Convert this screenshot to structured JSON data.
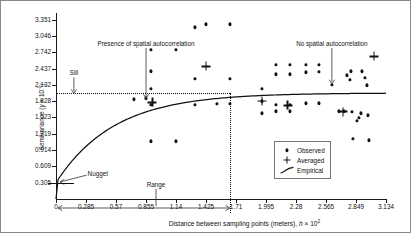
{
  "chart_data": {
    "type": "scatter",
    "title": "",
    "xlabel": "Distance between sampling points (meters), h × 10²",
    "ylabel": "Semivariance (γ × 10⁻¹)",
    "xlabel_parts": {
      "text": "Distance between sampling points (meters), ",
      "italic": "h",
      "times": " × 10",
      "exp": "2"
    },
    "ylabel_parts": {
      "text": "Semivariance (",
      "italic": "γ",
      "times": " × 10",
      "exp": "-1",
      "close": ")"
    },
    "xlim": [
      0,
      3.134
    ],
    "ylim": [
      0,
      3.4725
    ],
    "grid": false,
    "xticks": [
      "0",
      "0.285",
      "0.57",
      "0.855",
      "1.14",
      "1.425",
      "1.71",
      "1.995",
      "2.28",
      "2.565",
      "2.849",
      "3.134"
    ],
    "xtick_values": [
      0,
      0.285,
      0.57,
      0.855,
      1.14,
      1.425,
      1.71,
      1.995,
      2.28,
      2.565,
      2.849,
      3.134
    ],
    "yticks": [
      "0.305",
      "0.609",
      "0.914",
      "1.219",
      "1.523",
      "1.828",
      "2.132",
      "2.437",
      "2.742",
      "3.046",
      "3.351"
    ],
    "ytick_values": [
      0.305,
      0.609,
      0.914,
      1.219,
      1.523,
      1.828,
      2.132,
      2.437,
      2.742,
      3.046,
      3.351
    ],
    "legend_position": "bottom-right",
    "legend": [
      {
        "label": "Observed",
        "marker": "dot"
      },
      {
        "label": "Averaged",
        "marker": "cross"
      },
      {
        "label": "Empirical",
        "marker": "curve"
      }
    ],
    "annotations": [
      {
        "label": "Presence of spatial autocorrelation",
        "x": 0.855,
        "y": 2.95,
        "pointer_to_y": 1.86
      },
      {
        "label": "No spatial autocorrelation",
        "x": 2.62,
        "y": 2.95,
        "pointer_to_y": 2.13
      },
      {
        "label": "Sill",
        "x": 0.17,
        "y": 2.4,
        "pointer_to_y": 1.95
      },
      {
        "label": "Nugget",
        "x": 0.3,
        "y": 0.52,
        "pointer_to_x": 0.02,
        "pointer_to_y": 0.3
      },
      {
        "label": "Range",
        "x": 0.95,
        "y": 0.32
      }
    ],
    "model": {
      "name": "Empirical",
      "nugget": 0.305,
      "sill": 1.98,
      "range": 1.65
    },
    "series": [
      {
        "name": "Observed",
        "marker": "dot",
        "points": [
          [
            0.745,
            1.862
          ],
          [
            0.855,
            1.885
          ],
          [
            0.905,
            2.79
          ],
          [
            0.905,
            2.39
          ],
          [
            0.905,
            2.06
          ],
          [
            0.905,
            1.76
          ],
          [
            1.14,
            2.79
          ],
          [
            1.14,
            1.075
          ],
          [
            0.905,
            1.075
          ],
          [
            1.32,
            3.205
          ],
          [
            1.32,
            2.245
          ],
          [
            1.32,
            1.76
          ],
          [
            1.425,
            3.265
          ],
          [
            1.53,
            1.78
          ],
          [
            1.65,
            3.265
          ],
          [
            1.65,
            2.245
          ],
          [
            1.65,
            1.78
          ],
          [
            1.955,
            2.06
          ],
          [
            1.955,
            1.83
          ],
          [
            1.955,
            1.6
          ],
          [
            2.09,
            2.51
          ],
          [
            2.09,
            2.33
          ],
          [
            2.09,
            1.76
          ],
          [
            2.09,
            1.64
          ],
          [
            2.09,
            0.65
          ],
          [
            2.225,
            2.51
          ],
          [
            2.225,
            2.33
          ],
          [
            2.225,
            1.76
          ],
          [
            2.225,
            1.64
          ],
          [
            2.225,
            0.68
          ],
          [
            2.37,
            2.51
          ],
          [
            2.37,
            2.37
          ],
          [
            2.37,
            1.79
          ],
          [
            2.37,
            0.695
          ],
          [
            2.5,
            2.51
          ],
          [
            2.5,
            2.375
          ],
          [
            2.5,
            1.79
          ],
          [
            2.5,
            0.695
          ],
          [
            2.62,
            2.13
          ],
          [
            2.73,
            1.64
          ],
          [
            2.76,
            2.31
          ],
          [
            2.79,
            2.23
          ],
          [
            2.8,
            2.39
          ],
          [
            2.81,
            1.63
          ],
          [
            2.82,
            1.125
          ],
          [
            2.86,
            1.46
          ],
          [
            2.88,
            1.52
          ],
          [
            2.9,
            1.6
          ],
          [
            2.91,
            2.39
          ],
          [
            2.93,
            2.26
          ],
          [
            2.95,
            2.12
          ],
          [
            2.96,
            1.56
          ],
          [
            2.97,
            1.1
          ],
          [
            2.69,
            1.64
          ]
        ]
      },
      {
        "name": "Averaged",
        "marker": "cross",
        "points": [
          [
            0.915,
            1.805
          ],
          [
            1.425,
            2.475
          ],
          [
            1.955,
            1.83
          ],
          [
            2.2,
            1.75
          ],
          [
            2.725,
            1.63
          ],
          [
            3.02,
            2.665
          ]
        ]
      }
    ]
  }
}
